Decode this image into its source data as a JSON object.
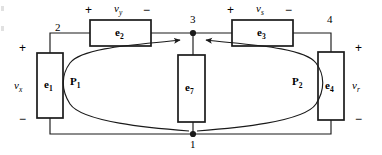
{
  "figure": {
    "kind": "circuit-diagram",
    "width": 382,
    "height": 155,
    "background": "#ffffff",
    "line_color": "#1a1a1a",
    "text_color": "#000000"
  },
  "nodes": [
    {
      "id": "n2",
      "label": "2",
      "x": 55,
      "y": 32
    },
    {
      "id": "n3",
      "label": "3",
      "x": 193,
      "y": 22,
      "dot": true
    },
    {
      "id": "n4",
      "label": "4",
      "x": 330,
      "y": 22
    },
    {
      "id": "n1",
      "label": "1",
      "x": 193,
      "y": 142,
      "dot": true
    }
  ],
  "elements": [
    {
      "id": "e1",
      "label": "e",
      "sub": "1",
      "x": 37,
      "y": 53,
      "w": 26,
      "h": 65
    },
    {
      "id": "e2",
      "label": "e",
      "sub": "2",
      "x": 90,
      "y": 20,
      "w": 61,
      "h": 26
    },
    {
      "id": "e3",
      "label": "e",
      "sub": "3",
      "x": 232,
      "y": 20,
      "w": 61,
      "h": 26
    },
    {
      "id": "e4",
      "label": "e",
      "sub": "4",
      "x": 318,
      "y": 52,
      "w": 26,
      "h": 68
    },
    {
      "id": "e7",
      "label": "e",
      "sub": "7",
      "x": 178,
      "y": 55,
      "w": 27,
      "h": 67
    }
  ],
  "voltages": [
    {
      "id": "vx",
      "symbol": "v",
      "sub": "x",
      "x": 16,
      "y": 80,
      "plus_x": 22,
      "plus_y": 45,
      "minus_x": 22,
      "minus_y": 116
    },
    {
      "id": "vy",
      "symbol": "v",
      "sub": "y",
      "x": 112,
      "y": 4,
      "plus_x": 87,
      "plus_y": 6,
      "minus_x": 143,
      "minus_y": 6
    },
    {
      "id": "vs",
      "symbol": "v",
      "sub": "s",
      "x": 255,
      "y": 4,
      "plus_x": 230,
      "plus_y": 6,
      "minus_x": 286,
      "minus_y": 6
    },
    {
      "id": "vr",
      "symbol": "v",
      "sub": "r",
      "x": 353,
      "y": 80,
      "plus_x": 356,
      "plus_y": 45,
      "minus_x": 356,
      "minus_y": 116
    }
  ],
  "paths": [
    {
      "id": "p1",
      "label": "P",
      "sub": "1",
      "x": 73,
      "y": 80
    },
    {
      "id": "p2",
      "label": "P",
      "sub": "2",
      "x": 295,
      "y": 80
    }
  ],
  "signs": {
    "plus": "+",
    "minus": "−"
  }
}
